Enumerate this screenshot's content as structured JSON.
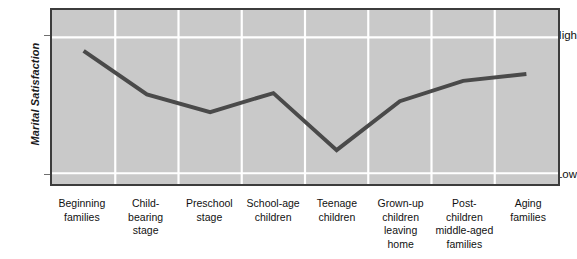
{
  "chart_data": {
    "type": "line",
    "title": "",
    "xlabel": "",
    "ylabel": "Marital Satisfaction",
    "categories": [
      "Beginning families",
      "Child-bearing stage",
      "Preschool stage",
      "School-age children",
      "Teenage children",
      "Grown-up children leaving home",
      "Post-children middle-aged families",
      "Aging families"
    ],
    "category_lines": [
      [
        "Beginning",
        "families"
      ],
      [
        "Child-",
        "bearing",
        "stage"
      ],
      [
        "Preschool",
        "stage"
      ],
      [
        "School-age",
        "children"
      ],
      [
        "Teenage",
        "children"
      ],
      [
        "Grown-up",
        "children",
        "leaving",
        "home"
      ],
      [
        "Post-",
        "children",
        "middle-aged",
        "families"
      ],
      [
        "Aging",
        "families"
      ]
    ],
    "values": [
      0.9,
      0.58,
      0.45,
      0.59,
      0.17,
      0.53,
      0.68,
      0.73
    ],
    "ytick_labels": [
      "High",
      "Low"
    ],
    "ytick_values": [
      1.0,
      0.0
    ],
    "ylim": [
      0,
      1
    ],
    "grid": {
      "vertical": true,
      "horizontal": true,
      "vertical_count": 7,
      "horizontal_values": [
        1.0,
        0.0
      ],
      "color": "#ffffff"
    },
    "legend": null,
    "series": [
      {
        "name": "Marital satisfaction across family life cycle",
        "values": [
          0.9,
          0.58,
          0.45,
          0.59,
          0.17,
          0.53,
          0.68,
          0.73
        ]
      }
    ],
    "colors": {
      "line": "#4a4a4a",
      "plot_background": "#c9c9c9",
      "plot_border": "#3c3c3c",
      "grid": "#ffffff",
      "text": "#111111"
    },
    "line_width": 4
  }
}
